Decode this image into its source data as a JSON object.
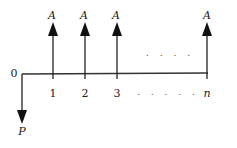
{
  "diagram": {
    "type": "cash-flow",
    "origin_label": "0",
    "present_value_label": "P",
    "payment_label": "A",
    "period_labels": [
      "1",
      "2",
      "3",
      "n"
    ],
    "ellipsis_top": ". . . .",
    "ellipsis_bottom": ". . . . .",
    "colors": {
      "line": "#222222",
      "background": "#ffffff"
    }
  }
}
